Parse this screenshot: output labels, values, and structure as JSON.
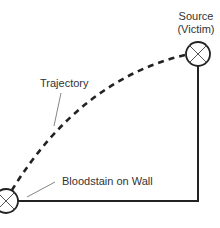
{
  "diagram": {
    "labels": {
      "source_line1": "Source",
      "source_line2": "(Victim)",
      "trajectory": "Trajectory",
      "bloodstain": "Bloodstain on Wall"
    },
    "nodes": [
      {
        "id": "source",
        "label": "Source (Victim)",
        "symbol": "circled-x",
        "cx": 198,
        "cy": 54
      },
      {
        "id": "bloodstain",
        "label": "Bloodstain on Wall",
        "symbol": "circled-x",
        "cx": 6,
        "cy": 201
      }
    ],
    "edges": [
      {
        "from": "source",
        "to": "bloodstain",
        "style": "dashed-curve",
        "label": "Trajectory"
      },
      {
        "from": "source",
        "to": "bloodstain",
        "style": "solid-right-angle"
      }
    ],
    "colors": {
      "stroke": "#222222",
      "text": "#333333",
      "leader": "#666666",
      "background": "#ffffff"
    }
  }
}
